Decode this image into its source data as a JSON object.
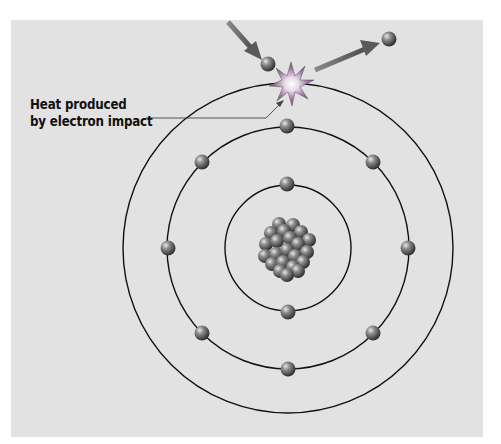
{
  "diagram": {
    "label": {
      "line1": "Heat produced",
      "line2": "by electron impact"
    },
    "colors": {
      "background": "#e2e2e2",
      "orbit": "#111111",
      "electron": "#7a7a7a",
      "arrow": "#666666",
      "star": "#8a6b8f"
    },
    "atom": {
      "center": [
        288,
        248
      ],
      "orbits": [
        {
          "name": "inner",
          "radius": 63,
          "electrons": 2
        },
        {
          "name": "middle",
          "radius": 121,
          "electrons": 8
        },
        {
          "name": "outer",
          "radius": 165,
          "electrons": 0
        }
      ],
      "nucleus_particles": 26
    },
    "incoming_electron": [
      268,
      64
    ],
    "outgoing_electron": [
      389,
      39
    ],
    "impact_point": [
      291,
      84
    ]
  }
}
